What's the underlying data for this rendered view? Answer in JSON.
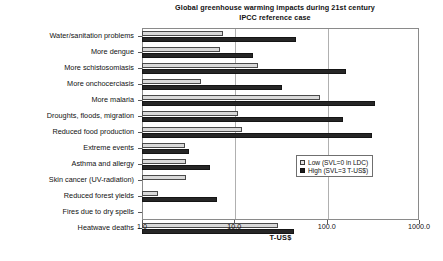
{
  "chart_data": {
    "type": "bar",
    "orientation": "horizontal",
    "title": "Global greenhouse warming impacts during 21st century",
    "subtitle": "IPCC reference case",
    "xlabel": "T-US$",
    "ylabel": "",
    "xscale": "log",
    "xlim": [
      1.0,
      1000.0
    ],
    "xticks": [
      1.0,
      10.0,
      100.0,
      1000.0
    ],
    "xticklabels": [
      "1.0",
      "10.0",
      "100.0",
      "1000.0"
    ],
    "grid": true,
    "legend_position": "right-middle",
    "categories": [
      "Water/sanitation problems",
      "More dengue",
      "More schistosomiasis",
      "More onchocerciasis",
      "More malaria",
      "Droughts, floods, migration",
      "Reduced food production",
      "Extreme events",
      "Asthma and allergy",
      "Skin cancer (UV-radiation)",
      "Reduced forest yields",
      "Fires due to dry spells",
      "Heatwave deaths"
    ],
    "series": [
      {
        "name": "Low (SVL=0 in LDC)",
        "color": "#d9d9d9",
        "values": [
          7.5,
          7.0,
          18.0,
          4.4,
          85.0,
          11.0,
          12.0,
          2.9,
          3.0,
          3.0,
          1.5,
          0.0,
          30.0
        ]
      },
      {
        "name": "High (SVL=3 T-US$)",
        "color": "#262626",
        "values": [
          46.0,
          16.0,
          160.0,
          33.0,
          330.0,
          150.0,
          310.0,
          3.2,
          5.4,
          0.0,
          6.5,
          0.0,
          44.0
        ]
      }
    ],
    "legend": [
      {
        "label": "Low (SVL=0 in LDC)",
        "swatch": "low"
      },
      {
        "label": "High (SVL=3 T-US$)",
        "swatch": "high"
      }
    ]
  }
}
